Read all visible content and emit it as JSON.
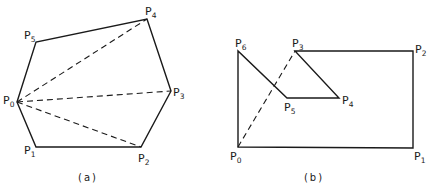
{
  "figures": [
    {
      "id": "a",
      "caption": "(a)",
      "caption_pos": [
        88,
        181
      ],
      "polygon": [
        [
          17,
          102
        ],
        [
          36,
          147
        ],
        [
          141,
          147
        ],
        [
          171,
          91
        ],
        [
          147,
          19
        ],
        [
          36,
          42
        ]
      ],
      "vertices": [
        {
          "name": "P",
          "sub": "0",
          "x": 17,
          "y": 102,
          "lx": 3,
          "ly": 104
        },
        {
          "name": "P",
          "sub": "1",
          "x": 36,
          "y": 147,
          "lx": 24,
          "ly": 154
        },
        {
          "name": "P",
          "sub": "2",
          "x": 141,
          "y": 147,
          "lx": 138,
          "ly": 162
        },
        {
          "name": "P",
          "sub": "3",
          "x": 171,
          "y": 91,
          "lx": 173,
          "ly": 96
        },
        {
          "name": "P",
          "sub": "4",
          "x": 147,
          "y": 19,
          "lx": 145,
          "ly": 15
        },
        {
          "name": "P",
          "sub": "5",
          "x": 36,
          "y": 42,
          "lx": 24,
          "ly": 39
        }
      ],
      "diagonals": [
        [
          [
            17,
            102
          ],
          [
            147,
            19
          ]
        ],
        [
          [
            17,
            102
          ],
          [
            171,
            91
          ]
        ],
        [
          [
            17,
            102
          ],
          [
            141,
            147
          ]
        ]
      ]
    },
    {
      "id": "b",
      "caption": "(b)",
      "caption_pos": [
        314,
        181
      ],
      "polygon": [
        [
          238,
          147
        ],
        [
          413,
          148
        ],
        [
          413,
          51
        ],
        [
          295,
          51
        ],
        [
          339,
          98
        ],
        [
          287,
          98
        ],
        [
          238,
          51
        ]
      ],
      "vertices": [
        {
          "name": "P",
          "sub": "0",
          "x": 238,
          "y": 147,
          "lx": 230,
          "ly": 160
        },
        {
          "name": "P",
          "sub": "1",
          "x": 413,
          "y": 148,
          "lx": 414,
          "ly": 160
        },
        {
          "name": "P",
          "sub": "2",
          "x": 413,
          "y": 51,
          "lx": 415,
          "ly": 53
        },
        {
          "name": "P",
          "sub": "3",
          "x": 295,
          "y": 51,
          "lx": 292,
          "ly": 47
        },
        {
          "name": "P",
          "sub": "4",
          "x": 339,
          "y": 98,
          "lx": 342,
          "ly": 104
        },
        {
          "name": "P",
          "sub": "5",
          "x": 287,
          "y": 98,
          "lx": 284,
          "ly": 111
        },
        {
          "name": "P",
          "sub": "6",
          "x": 238,
          "y": 51,
          "lx": 235,
          "ly": 47
        }
      ],
      "diagonals": [
        [
          [
            238,
            147
          ],
          [
            295,
            51
          ]
        ]
      ]
    }
  ]
}
